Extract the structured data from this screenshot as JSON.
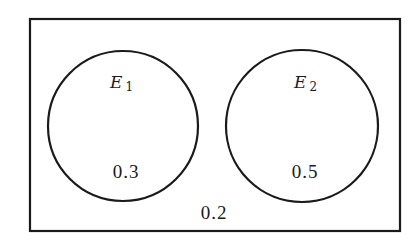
{
  "diagram": {
    "type": "venn",
    "sample_space": {
      "probability_outside": "0.2",
      "stroke_color": "#1a1a1a"
    },
    "sets": [
      {
        "name": "E",
        "subscript": "1",
        "probability": "0.3"
      },
      {
        "name": "E",
        "subscript": "2",
        "probability": "0.5"
      }
    ],
    "relationship": "disjoint"
  }
}
